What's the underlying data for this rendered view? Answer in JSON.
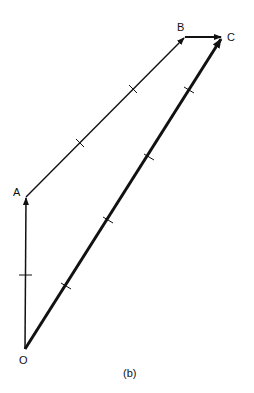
{
  "figure": {
    "caption": "(b)",
    "points": {
      "O": {
        "label": "O",
        "x": 25,
        "y": 349
      },
      "A": {
        "label": "A",
        "x": 26,
        "y": 197
      },
      "B": {
        "label": "B",
        "x": 185,
        "y": 37
      },
      "C": {
        "label": "C",
        "x": 222,
        "y": 37
      }
    },
    "vectors": [
      {
        "from": "O",
        "to": "A",
        "weight": "thin",
        "ticks": 1
      },
      {
        "from": "A",
        "to": "B",
        "weight": "thin",
        "ticks": 2
      },
      {
        "from": "B",
        "to": "C",
        "weight": "thin",
        "ticks": 0
      },
      {
        "from": "O",
        "to": "C",
        "weight": "thick",
        "ticks": 4
      }
    ],
    "colors": {
      "line": "#111111",
      "background": "#ffffff"
    }
  }
}
